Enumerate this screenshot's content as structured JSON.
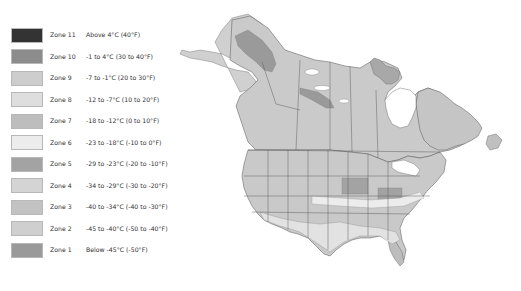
{
  "legend": {
    "items": [
      {
        "zone": "Zone 11",
        "range": "Above 4°C (40°F)",
        "color": "#333333"
      },
      {
        "zone": "Zone 10",
        "range": "-1 to 4°C (30 to 40°F)",
        "color": "#8c8c8c"
      },
      {
        "zone": "Zone 9",
        "range": "-7 to -1°C (20 to 30°F)",
        "color": "#cdcdcd"
      },
      {
        "zone": "Zone 8",
        "range": "-12 to -7°C (10 to 20°F)",
        "color": "#dedede"
      },
      {
        "zone": "Zone 7",
        "range": "-18 to -12°C (0 to 10°F)",
        "color": "#bdbdbd"
      },
      {
        "zone": "Zone 6",
        "range": "-23 to -18°C (-10 to 0°F)",
        "color": "#ececec"
      },
      {
        "zone": "Zone 5",
        "range": "-29 to -23°C (-20 to -10°F)",
        "color": "#a3a3a3"
      },
      {
        "zone": "Zone 4",
        "range": "-34 to -29°C (-30 to -20°F)",
        "color": "#d4d4d4"
      },
      {
        "zone": "Zone 3",
        "range": "-40 to -34°C (-40 to -30°F)",
        "color": "#c2c2c2"
      },
      {
        "zone": "Zone 2",
        "range": "-45 to -40°C (-50 to -40°F)",
        "color": "#cfcfcf"
      },
      {
        "zone": "Zone 1",
        "range": "Below -45°C (-50°F)",
        "color": "#9a9a9a"
      }
    ]
  },
  "map": {
    "region": "North America (Canada and United States)",
    "description": "Plant hardiness zones map"
  }
}
